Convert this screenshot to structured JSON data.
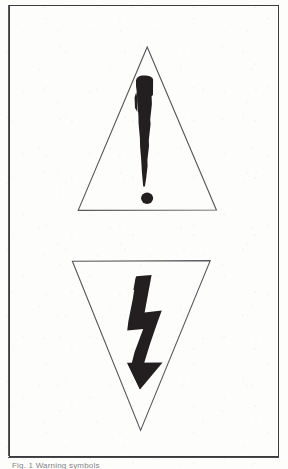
{
  "document": {
    "kind": "scanned-figure-page",
    "background_color": "#fdfdfc",
    "ink_color": "#231f20",
    "frame": {
      "border_color": "#3b3b3d",
      "x": 9,
      "y": 5,
      "width": 268,
      "height": 450
    },
    "caption": {
      "text": "Fig. 1  Warning symbols",
      "clipped": "true"
    }
  },
  "figures": [
    {
      "index": 1,
      "name": "warning-exclamation-triangle",
      "label": "Exclamation mark in upright triangle",
      "meaning": "General warning / caution",
      "outline_color": "#55555a",
      "fill_color": "#231f20",
      "triangle": {
        "orientation": "point-up",
        "apex_x": 147,
        "apex_y": 47,
        "base_left_x": 78,
        "base_right_x": 216,
        "base_y": 210
      },
      "glyph": {
        "type": "exclamation-mark",
        "bar_top_y": 76,
        "bar_bottom_y": 186,
        "dot_center_x": 147,
        "dot_center_y": 198,
        "dot_radius": 6
      }
    },
    {
      "index": 2,
      "name": "warning-lightning-bolt-triangle",
      "label": "Lightning bolt arrow in inverted triangle",
      "meaning": "Dangerous voltage / electric shock hazard",
      "outline_color": "#55555a",
      "fill_color": "#231f20",
      "triangle": {
        "orientation": "point-down",
        "apex_x": 140,
        "apex_y": 430,
        "top_left_x": 72,
        "top_right_x": 210,
        "top_y": 261
      },
      "glyph": {
        "type": "lightning-bolt-arrow",
        "top_y": 275,
        "arrow_tip_y": 389,
        "arrow_head_left_x": 127,
        "arrow_head_right_x": 163
      }
    }
  ]
}
